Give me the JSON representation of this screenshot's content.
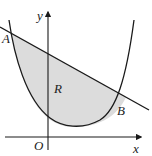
{
  "diagram": {
    "colors": {
      "background": "#ffffff",
      "stroke": "#1a1a1a",
      "region_fill": "#dcdcdc"
    },
    "labels": {
      "y_axis": "y",
      "x_axis": "x",
      "origin": "O",
      "point_a": "A",
      "point_b": "B",
      "region": "R"
    }
  }
}
